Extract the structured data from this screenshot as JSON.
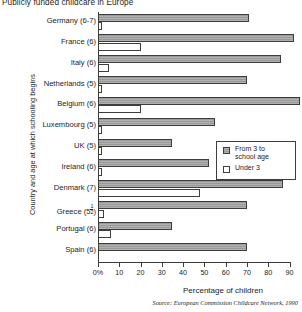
{
  "chart_data": {
    "type": "bar",
    "orientation": "horizontal",
    "title": "Publicly funded childcare in Europe",
    "xlabel": "Percentage of children",
    "ylabel": "Country and age at which schooling begins",
    "xlim": [
      0,
      90
    ],
    "xticks": [
      "0%",
      "10",
      "20",
      "30",
      "40",
      "50",
      "60",
      "70",
      "80",
      "90"
    ],
    "xtick_values": [
      0,
      10,
      20,
      30,
      40,
      50,
      60,
      70,
      80,
      90
    ],
    "grid": false,
    "legend_position": "middle-right",
    "source": "Source: European Commission Childcare Network, 1990",
    "categories": [
      "Germany (6-7)",
      "France (6)",
      "Italy (6)",
      "Netherlands (5)",
      "Belgium (6)",
      "Luxembourg (5)",
      "UK (5)",
      "Ireland (6)",
      "Denmark (7)",
      "Greece (5½)",
      "Portugal (6)",
      "Spain (6)"
    ],
    "series": [
      {
        "name": "From 3 to school age",
        "swatch": "hatched-grey",
        "color": "#9a9a9a",
        "values": [
          71,
          92,
          86,
          70,
          95,
          55,
          35,
          52,
          87,
          70,
          35,
          70
        ]
      },
      {
        "name": "Under 3",
        "swatch": "white",
        "color": "#ffffff",
        "values": [
          2,
          20,
          5,
          2,
          20,
          2,
          2,
          2,
          48,
          3,
          6,
          0
        ]
      }
    ]
  },
  "legend": {
    "entries": [
      {
        "label": "From 3 to\nschool age"
      },
      {
        "label": "Under 3"
      }
    ]
  }
}
